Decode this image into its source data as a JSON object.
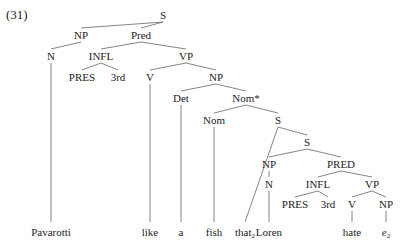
{
  "example_number": "(31)",
  "nodes": [
    {
      "id": "S",
      "label": "S",
      "x": 163,
      "y": 19
    },
    {
      "id": "NP1",
      "label": "NP",
      "x": 81,
      "y": 39
    },
    {
      "id": "Pred",
      "label": "Pred",
      "x": 141,
      "y": 39
    },
    {
      "id": "N1",
      "label": "N",
      "x": 51,
      "y": 60
    },
    {
      "id": "INFL1",
      "label": "INFL",
      "x": 101,
      "y": 60
    },
    {
      "id": "VP1",
      "label": "VP",
      "x": 186,
      "y": 60
    },
    {
      "id": "PRES1",
      "label": "PRES",
      "x": 82,
      "y": 81
    },
    {
      "id": "3rd1",
      "label": "3rd",
      "x": 118,
      "y": 81
    },
    {
      "id": "V1",
      "label": "V",
      "x": 150,
      "y": 81
    },
    {
      "id": "NP2",
      "label": "NP",
      "x": 216,
      "y": 81
    },
    {
      "id": "Det",
      "label": "Det",
      "x": 181,
      "y": 102
    },
    {
      "id": "NomStar",
      "label": "Nom*",
      "x": 246,
      "y": 102
    },
    {
      "id": "Nom",
      "label": "Nom",
      "x": 214,
      "y": 124
    },
    {
      "id": "S2",
      "label": "S",
      "x": 278,
      "y": 124
    },
    {
      "id": "S3",
      "label": "S",
      "x": 307,
      "y": 146
    },
    {
      "id": "NP3",
      "label": "NP",
      "x": 269,
      "y": 168
    },
    {
      "id": "PRED",
      "label": "PRED",
      "x": 341,
      "y": 168
    },
    {
      "id": "N2",
      "label": "N",
      "x": 269,
      "y": 188
    },
    {
      "id": "INFL2",
      "label": "INFL",
      "x": 318,
      "y": 188
    },
    {
      "id": "VP2",
      "label": "VP",
      "x": 372,
      "y": 188
    },
    {
      "id": "PRES2",
      "label": "PRES",
      "x": 295,
      "y": 208
    },
    {
      "id": "3rd2",
      "label": "3rd",
      "x": 328,
      "y": 208
    },
    {
      "id": "V2",
      "label": "V",
      "x": 352,
      "y": 208
    },
    {
      "id": "NP4",
      "label": "NP",
      "x": 386,
      "y": 208
    }
  ],
  "words": [
    {
      "id": "w-pavarotti",
      "label": "Pavarotti",
      "x": 51,
      "y": 236
    },
    {
      "id": "w-like",
      "label": "like",
      "x": 150,
      "y": 236
    },
    {
      "id": "w-a",
      "label": "a",
      "x": 181,
      "y": 236
    },
    {
      "id": "w-fish",
      "label": "fish",
      "x": 214,
      "y": 236
    },
    {
      "id": "w-that",
      "label": "that",
      "sub": "2",
      "x": 245,
      "y": 236
    },
    {
      "id": "w-loren",
      "label": "Loren",
      "x": 269,
      "y": 236
    },
    {
      "id": "w-hate",
      "label": "hate",
      "x": 352,
      "y": 236
    },
    {
      "id": "w-e",
      "label": "e",
      "sub": "2",
      "x": 386,
      "y": 236,
      "italic": true
    }
  ],
  "edges": [
    [
      "S",
      "NP1"
    ],
    [
      "S",
      "Pred"
    ],
    [
      "NP1",
      "N1"
    ],
    [
      "Pred",
      "INFL1"
    ],
    [
      "Pred",
      "VP1"
    ],
    [
      "INFL1",
      "PRES1"
    ],
    [
      "INFL1",
      "3rd1"
    ],
    [
      "VP1",
      "V1"
    ],
    [
      "VP1",
      "NP2"
    ],
    [
      "NP2",
      "Det"
    ],
    [
      "NP2",
      "NomStar"
    ],
    [
      "NomStar",
      "Nom"
    ],
    [
      "NomStar",
      "S2"
    ],
    [
      "S2",
      "w-that"
    ],
    [
      "S2",
      "S3"
    ],
    [
      "S3",
      "NP3"
    ],
    [
      "S3",
      "PRED"
    ],
    [
      "NP3",
      "N2"
    ],
    [
      "PRED",
      "INFL2"
    ],
    [
      "PRED",
      "VP2"
    ],
    [
      "INFL2",
      "PRES2"
    ],
    [
      "INFL2",
      "3rd2"
    ],
    [
      "VP2",
      "V2"
    ],
    [
      "VP2",
      "NP4"
    ],
    [
      "N1",
      "w-pavarotti"
    ],
    [
      "V1",
      "w-like"
    ],
    [
      "Det",
      "w-a"
    ],
    [
      "Nom",
      "w-fish"
    ],
    [
      "N2",
      "w-loren"
    ],
    [
      "V2",
      "w-hate"
    ],
    [
      "NP4",
      "w-e"
    ]
  ]
}
